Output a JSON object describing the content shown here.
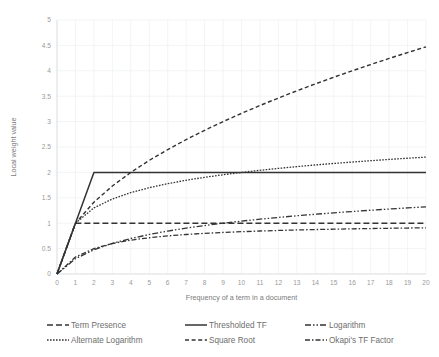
{
  "chart_data": {
    "type": "line",
    "title": "",
    "xlabel": "Frequency of a term in a document",
    "ylabel": "Local weight value",
    "xlim": [
      0,
      20
    ],
    "ylim": [
      0,
      5
    ],
    "grid": true,
    "legend_position": "bottom",
    "xticks": [
      "0",
      "1",
      "2",
      "3",
      "4",
      "5",
      "6",
      "7",
      "8",
      "9",
      "10",
      "11",
      "12",
      "13",
      "14",
      "15",
      "16",
      "17",
      "18",
      "19",
      "20"
    ],
    "yticks": [
      "0",
      "0.5",
      "1",
      "1.5",
      "2",
      "2.5",
      "3",
      "3.5",
      "4",
      "4.5",
      "5"
    ],
    "x": [
      0,
      1,
      2,
      3,
      4,
      5,
      6,
      7,
      8,
      9,
      10,
      11,
      12,
      13,
      14,
      15,
      16,
      17,
      18,
      19,
      20
    ],
    "series": [
      {
        "name": "Term Presence",
        "style": "long-dash",
        "dash": "6,3",
        "width": 1.5,
        "color": "#333333",
        "values": [
          0,
          1,
          1,
          1,
          1,
          1,
          1,
          1,
          1,
          1,
          1,
          1,
          1,
          1,
          1,
          1,
          1,
          1,
          1,
          1,
          1
        ]
      },
      {
        "name": "Thresholded TF",
        "style": "solid",
        "dash": "none",
        "width": 1.5,
        "color": "#333333",
        "values": [
          0,
          1,
          2,
          2,
          2,
          2,
          2,
          2,
          2,
          2,
          2,
          2,
          2,
          2,
          2,
          2,
          2,
          2,
          2,
          2,
          2
        ]
      },
      {
        "name": "Logarithm",
        "style": "dash-dot-dot",
        "dash": "6,2,1.5,2,1.5,2",
        "width": 1.3,
        "color": "#333333",
        "values": [
          0,
          0.301,
          0.477,
          0.602,
          0.699,
          0.778,
          0.845,
          0.903,
          0.954,
          1.0,
          1.041,
          1.079,
          1.114,
          1.146,
          1.176,
          1.204,
          1.23,
          1.255,
          1.279,
          1.301,
          1.322
        ]
      },
      {
        "name": "Alternate Logarithm",
        "style": "fine-dot",
        "dash": "1.6,1.4",
        "width": 1.3,
        "color": "#333333",
        "values": [
          0,
          1.0,
          1.301,
          1.477,
          1.602,
          1.699,
          1.778,
          1.845,
          1.903,
          1.954,
          2.0,
          2.041,
          2.079,
          2.114,
          2.146,
          2.176,
          2.204,
          2.23,
          2.255,
          2.279,
          2.301
        ]
      },
      {
        "name": "Square Root",
        "style": "dash",
        "dash": "4,2.6",
        "width": 1.4,
        "color": "#333333",
        "values": [
          0,
          1.0,
          1.414,
          1.732,
          2.0,
          2.236,
          2.449,
          2.646,
          2.828,
          3.0,
          3.162,
          3.317,
          3.464,
          3.606,
          3.742,
          3.873,
          4.0,
          4.123,
          4.243,
          4.359,
          4.472
        ]
      },
      {
        "name": "Okapi's TF Factor",
        "style": "dash-dot",
        "dash": "5,2,1.5,2",
        "width": 1.3,
        "color": "#333333",
        "values": [
          0,
          0.333,
          0.5,
          0.6,
          0.667,
          0.714,
          0.75,
          0.778,
          0.8,
          0.818,
          0.833,
          0.846,
          0.857,
          0.867,
          0.875,
          0.882,
          0.889,
          0.895,
          0.9,
          0.905,
          0.909
        ]
      }
    ]
  },
  "legend": {
    "items": [
      {
        "label": "Term Presence",
        "series": 0
      },
      {
        "label": "Thresholded TF",
        "series": 1
      },
      {
        "label": "Logarithm",
        "series": 2
      },
      {
        "label": "Alternate Logarithm",
        "series": 3
      },
      {
        "label": "Square Root",
        "series": 4
      },
      {
        "label": "Okapi's TF Factor",
        "series": 5
      }
    ]
  }
}
